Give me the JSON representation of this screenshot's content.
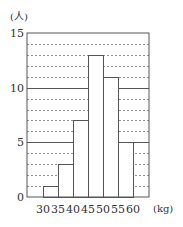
{
  "chart_data": {
    "type": "bar",
    "title": "",
    "xlabel": "(kg)",
    "ylabel": "(人)",
    "categories": [
      "30-35",
      "35-40",
      "40-45",
      "45-50",
      "50-55",
      "55-60"
    ],
    "bin_edges": [
      30,
      35,
      40,
      45,
      50,
      55,
      60
    ],
    "values": [
      1,
      3,
      7,
      13,
      11,
      5
    ],
    "ylim": [
      0,
      15
    ],
    "yticks": [
      0,
      5,
      10,
      15
    ],
    "xtick_labels": [
      "30",
      "35",
      "40",
      "45",
      "50",
      "55",
      "60"
    ],
    "grid": {
      "minor_dashed_every": 1,
      "major_solid_every": 5
    },
    "legend": null
  },
  "labels": {
    "y_unit": "(人)",
    "x_unit": "(kg)",
    "y0": "0",
    "y5": "5",
    "y10": "10",
    "y15": "15"
  },
  "colors": {
    "line": "#555555",
    "dash": "#777777",
    "bar_fill": "#ffffff"
  }
}
